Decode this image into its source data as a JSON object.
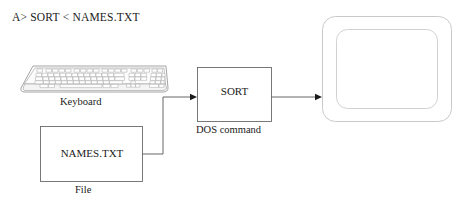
{
  "diagram": {
    "title_line": "A> SORT < NAMES.TXT",
    "stroke_color": "#555555",
    "monitor_stroke_color": "#c9c9c9",
    "text_color": "#1a1a1a",
    "background_color": "#ffffff",
    "nodes": {
      "keyboard": {
        "label": "Keyboard",
        "icon": "keyboard-illustration"
      },
      "file": {
        "box_text": "NAMES.TXT",
        "label": "File"
      },
      "command": {
        "box_text": "SORT",
        "label": "DOS command"
      },
      "monitor": {
        "label": "",
        "icon": "monitor-illustration"
      }
    },
    "edges": [
      {
        "from": "file",
        "to": "command",
        "arrow": true
      },
      {
        "from": "command",
        "to": "monitor",
        "arrow": true
      }
    ]
  }
}
